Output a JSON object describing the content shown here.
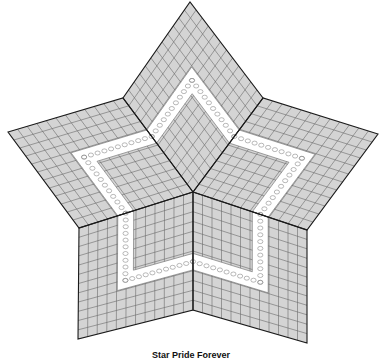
{
  "diagram": {
    "title": "Star Pride Forever",
    "type": "quilt-pattern",
    "colors": {
      "fill": "#d4d4d4",
      "grid": "#6a6a6a",
      "seam": "#1a1a1a",
      "band": "#ffffff",
      "chain": "#8a8a8a"
    },
    "center": [
      193,
      192
    ],
    "points": {
      "top": [
        190,
        2
      ],
      "left": [
        8,
        132
      ],
      "right": [
        378,
        134
      ],
      "bottom_left": [
        78,
        339
      ],
      "bottom_right": [
        307,
        343
      ]
    },
    "notches": {
      "upper_left": [
        123,
        98
      ],
      "upper_right": [
        263,
        98
      ],
      "lower_left": [
        79,
        228
      ],
      "lower_right": [
        307,
        230
      ],
      "bottom": [
        193,
        310
      ]
    },
    "rhombi": [
      {
        "name": "top",
        "verts": [
          "center",
          "upper_left",
          "top",
          "upper_right"
        ]
      },
      {
        "name": "left",
        "verts": [
          "center",
          "upper_left",
          "left",
          "lower_left"
        ]
      },
      {
        "name": "right",
        "verts": [
          "center",
          "upper_right",
          "right",
          "lower_right"
        ]
      },
      {
        "name": "bottom-left",
        "verts": [
          "center",
          "lower_left",
          "bottom_left",
          "bottom"
        ]
      },
      {
        "name": "bottom-right",
        "verts": [
          "center",
          "lower_right",
          "bottom_right",
          "bottom"
        ]
      }
    ],
    "grid_divisions": 12,
    "band": {
      "start": 0.22,
      "end": 0.36
    }
  }
}
